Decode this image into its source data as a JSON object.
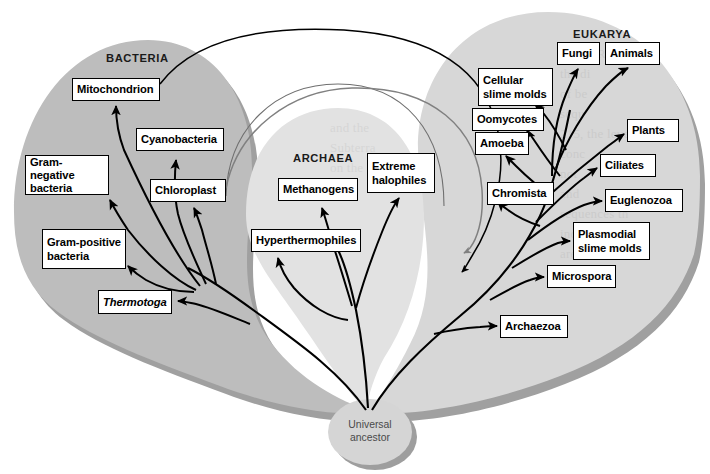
{
  "figure": {
    "background_color": "#ffffff"
  },
  "colors": {
    "bacteria_fill": "#bdbdbd",
    "archaea_fill": "#e2e2e2",
    "eukarya_fill": "#d7d7d7",
    "shadow": "#a0a0a0",
    "ancestor_fill": "#d5d5d5",
    "ancestor_shadow": "#9e9e9e",
    "branch_black": "#000000",
    "branch_gray": "#808080",
    "box_border": "#000000",
    "box_fill": "#ffffff",
    "label_text": "#1a1a1a"
  },
  "domains": [
    {
      "id": "bacteria",
      "label": "BACTERIA",
      "x": 106,
      "y": 52
    },
    {
      "id": "archaea",
      "label": "ARCHAEA",
      "x": 293,
      "y": 152
    },
    {
      "id": "eukarya",
      "label": "EUKARYA",
      "x": 573,
      "y": 28
    }
  ],
  "ancestor": {
    "name": "universal-ancestor",
    "label": "Universal\nancestor",
    "cx": 370,
    "cy": 432,
    "rx": 42,
    "ry": 33
  },
  "taxa": [
    {
      "id": "mitochondrion",
      "label": "Mitochondrion",
      "domain": "bacteria",
      "x": 72,
      "y": 78,
      "w": 88,
      "h": 23
    },
    {
      "id": "cyanobacteria",
      "label": "Cyanobacteria",
      "domain": "bacteria",
      "x": 136,
      "y": 128,
      "w": 88,
      "h": 23
    },
    {
      "id": "gram-negative",
      "label": "Gram-negative\nbacteria",
      "domain": "bacteria",
      "x": 25,
      "y": 155,
      "w": 84,
      "h": 40
    },
    {
      "id": "chloroplast",
      "label": "Chloroplast",
      "domain": "bacteria",
      "x": 150,
      "y": 179,
      "w": 76,
      "h": 23
    },
    {
      "id": "gram-positive",
      "label": "Gram-positive\nbacteria",
      "domain": "bacteria",
      "x": 42,
      "y": 229,
      "w": 84,
      "h": 40
    },
    {
      "id": "thermotoga",
      "label": "Thermotoga",
      "domain": "bacteria",
      "x": 98,
      "y": 290,
      "w": 74,
      "h": 24,
      "italic": true
    },
    {
      "id": "methanogens",
      "label": "Methanogens",
      "domain": "archaea",
      "x": 278,
      "y": 178,
      "w": 80,
      "h": 23
    },
    {
      "id": "extreme-halophiles",
      "label": "Extreme\nhalophiles",
      "domain": "archaea",
      "x": 367,
      "y": 153,
      "w": 68,
      "h": 40
    },
    {
      "id": "hyperthermophiles",
      "label": "Hyperthermophiles",
      "domain": "archaea",
      "x": 251,
      "y": 229,
      "w": 110,
      "h": 23
    },
    {
      "id": "cellular-slime-molds",
      "label": "Cellular\nslime molds",
      "domain": "eukarya",
      "x": 478,
      "y": 68,
      "w": 75,
      "h": 38
    },
    {
      "id": "fungi",
      "label": "Fungi",
      "domain": "eukarya",
      "x": 557,
      "y": 42,
      "w": 43,
      "h": 23
    },
    {
      "id": "animals",
      "label": "Animals",
      "domain": "eukarya",
      "x": 605,
      "y": 42,
      "w": 55,
      "h": 23
    },
    {
      "id": "oomycotes",
      "label": "Oomycotes",
      "domain": "eukarya",
      "x": 472,
      "y": 108,
      "w": 72,
      "h": 23
    },
    {
      "id": "plants",
      "label": "Plants",
      "domain": "eukarya",
      "x": 627,
      "y": 119,
      "w": 52,
      "h": 23
    },
    {
      "id": "amoeba",
      "label": "Amoeba",
      "domain": "eukarya",
      "x": 475,
      "y": 132,
      "w": 54,
      "h": 23
    },
    {
      "id": "ciliates",
      "label": "Ciliates",
      "domain": "eukarya",
      "x": 600,
      "y": 154,
      "w": 56,
      "h": 23
    },
    {
      "id": "chromista",
      "label": "Chromista",
      "domain": "eukarya",
      "x": 487,
      "y": 182,
      "w": 67,
      "h": 23
    },
    {
      "id": "euglenozoa",
      "label": "Euglenozoa",
      "domain": "eukarya",
      "x": 605,
      "y": 189,
      "w": 78,
      "h": 23
    },
    {
      "id": "plasmodial-slime-molds",
      "label": "Plasmodial\nslime molds",
      "domain": "eukarya",
      "x": 573,
      "y": 222,
      "w": 77,
      "h": 38
    },
    {
      "id": "microspora",
      "label": "Microspora",
      "domain": "eukarya",
      "x": 547,
      "y": 265,
      "w": 69,
      "h": 23
    },
    {
      "id": "archaezoa",
      "label": "Archaezoa",
      "domain": "eukarya",
      "x": 500,
      "y": 315,
      "w": 68,
      "h": 23
    }
  ],
  "ghost_text": {
    "right_block": "EUKARYA\nthe di\nof be\nsequ\n215, the level\nconc\nnot\nand\nsequences th\nindu\nare",
    "mid_block": "and the\nSubterra\non the e"
  }
}
